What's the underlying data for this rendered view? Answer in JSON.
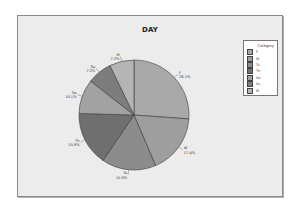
{
  "chart_data": {
    "type": "pie",
    "title": "DAY",
    "legend_title": "Category",
    "legend_position": "right",
    "start_angle": "12 o'clock",
    "direction": "clockwise",
    "slices": [
      {
        "label": "F",
        "value": 26.1,
        "text": "26.1%",
        "color": "#a9a9a9"
      },
      {
        "label": "W",
        "value": 17.4,
        "text": "17.4%",
        "color": "#9e9e9e"
      },
      {
        "label": "Tu",
        "value": 15.9,
        "text": "15.9%",
        "color": "#8c8c8c"
      },
      {
        "label": "Th",
        "value": 15.9,
        "text": "15.9%",
        "color": "#6f6f6f"
      },
      {
        "label": "Sa",
        "value": 10.1,
        "text": "10.1%",
        "color": "#a2a2a2"
      },
      {
        "label": "Su",
        "value": 7.2,
        "text": "7.2%",
        "color": "#7d7d7d"
      },
      {
        "label": "M",
        "value": 7.2,
        "text": "7.2%",
        "color": "#b4b4b4"
      }
    ]
  },
  "legend": {
    "title": "Category",
    "items": [
      {
        "label": "F",
        "color": "#a9a9a9"
      },
      {
        "label": "W",
        "color": "#9e9e9e"
      },
      {
        "label": "Tu",
        "color": "#8c8c8c"
      },
      {
        "label": "Th",
        "color": "#6f6f6f"
      },
      {
        "label": "Sa",
        "color": "#a2a2a2"
      },
      {
        "label": "Su",
        "color": "#7d7d7d"
      },
      {
        "label": "M",
        "color": "#b4b4b4"
      }
    ]
  }
}
